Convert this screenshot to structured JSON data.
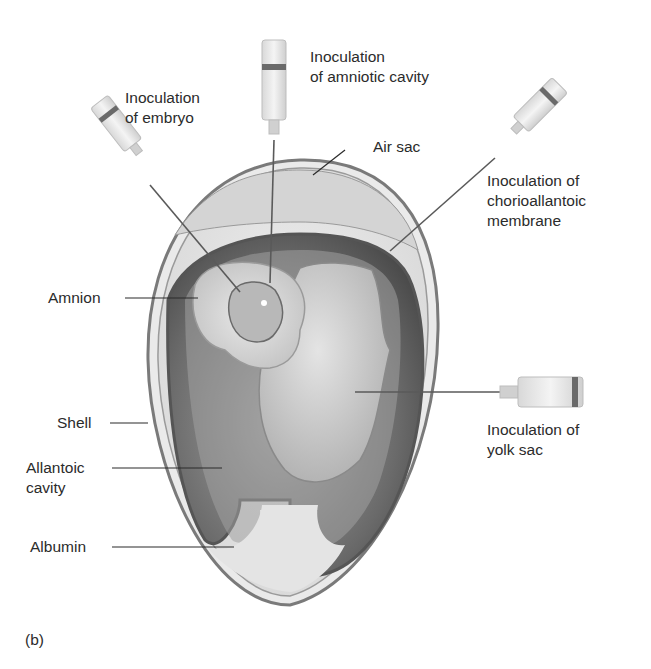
{
  "figure": {
    "panel_label": "(b)",
    "labels": {
      "inoc_embryo": "Inoculation\nof embryo",
      "inoc_amniotic": "Inoculation\nof amniotic cavity",
      "air_sac": "Air sac",
      "inoc_chorio": "Inoculation of\nchorioallantoic\nmembrane",
      "amnion": "Amnion",
      "shell": "Shell",
      "allantoic": "Allantoic\ncavity",
      "albumin": "Albumin",
      "inoc_yolk": "Inoculation of\nyolk sac"
    },
    "colors": {
      "background": "#ffffff",
      "shell_outline": "#7a7a7a",
      "albumin": "#e6e6e6",
      "allantoic_dark": "#6e6e6e",
      "yolk": "#c9c9c9",
      "text": "#2b2b2b"
    }
  }
}
